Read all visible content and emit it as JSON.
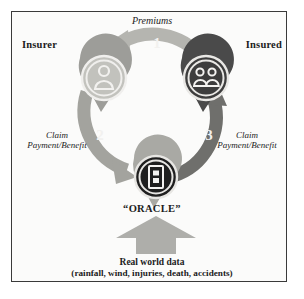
{
  "diagram": {
    "background_color": "#fbfbfa",
    "border_color": "#3a3a3a",
    "nodes": [
      {
        "id": "insurer",
        "label": "Insurer",
        "icon": "person-icon",
        "pin_color": "#9d9d99",
        "circle_color": "#b3b3ae"
      },
      {
        "id": "insured",
        "label": "Insured",
        "icon": "group-of-people-icon",
        "pin_color": "#4a4a4a",
        "circle_color": "#3d3d3d"
      },
      {
        "id": "oracle",
        "label": "“ORACLE”",
        "icon": "document-device-icon",
        "pin_color": "#a9a9a4",
        "circle_color": "#1f1f1f"
      }
    ],
    "flows": [
      {
        "id": "flow-1",
        "number": "1",
        "label": "Premiums",
        "from": "insured",
        "to": "insurer",
        "color": "#b5b5b0"
      },
      {
        "id": "flow-2",
        "number": "2",
        "label": "Claim\nPayment/Benefit",
        "label_line1": "Claim",
        "label_line2": "Payment/Benefit",
        "from": "insurer",
        "to": "oracle",
        "color": "#a3a39e"
      },
      {
        "id": "flow-3",
        "number": "3",
        "label": "Claim\nPayment/Benefit",
        "label_line1": "Claim",
        "label_line2": "Payment/Benefit",
        "from": "oracle",
        "to": "insured",
        "color": "#6f6f6c"
      }
    ],
    "input": {
      "id": "real-world-data",
      "arrow_color": "#aeaeaa",
      "line1": "Real world data",
      "line2": "(rainfall, wind, injuries, death, accidents)"
    }
  }
}
